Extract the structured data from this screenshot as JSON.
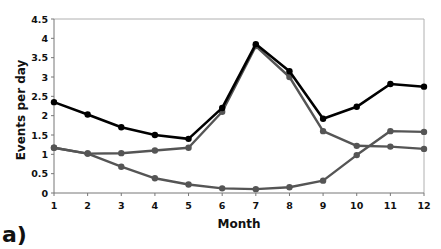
{
  "chart_data": {
    "type": "line",
    "title": "",
    "panel_label": "a)",
    "xlabel": "Month",
    "ylabel": "Events per day",
    "x": [
      1,
      2,
      3,
      4,
      5,
      6,
      7,
      8,
      9,
      10,
      11,
      12
    ],
    "x_tick_labels": [
      "1",
      "2",
      "3",
      "4",
      "5",
      "6",
      "7",
      "8",
      "9",
      "10",
      "11",
      "12"
    ],
    "y_tick_labels": [
      "0",
      "0.5",
      "1",
      "1.5",
      "2",
      "2.5",
      "3",
      "3.5",
      "4",
      "4.5"
    ],
    "ylim": [
      0,
      4.5
    ],
    "grid": false,
    "legend": "none",
    "series": [
      {
        "name": "series-black",
        "color": "#000000",
        "values": [
          2.35,
          2.03,
          1.7,
          1.5,
          1.4,
          2.2,
          3.85,
          3.15,
          1.92,
          2.23,
          2.82,
          2.75
        ]
      },
      {
        "name": "series-gray-a",
        "color": "#555555",
        "values": [
          1.17,
          1.02,
          1.03,
          1.1,
          1.17,
          2.1,
          3.8,
          3.0,
          1.6,
          1.22,
          1.2,
          1.14
        ]
      },
      {
        "name": "series-gray-b",
        "color": "#555555",
        "values": [
          1.17,
          1.02,
          0.68,
          0.38,
          0.22,
          0.12,
          0.1,
          0.15,
          0.32,
          0.98,
          1.6,
          1.58
        ]
      }
    ]
  }
}
